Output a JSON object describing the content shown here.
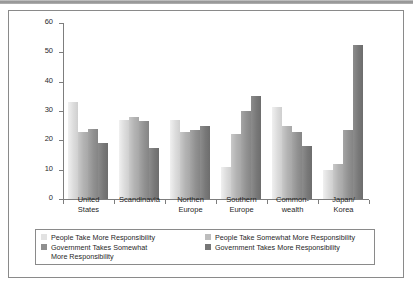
{
  "chart_data": {
    "type": "bar",
    "title": "",
    "subtitle": "",
    "xlabel": "",
    "ylabel": "",
    "ylim": [
      0,
      60
    ],
    "yticks": [
      0,
      10,
      20,
      30,
      40,
      50,
      60
    ],
    "grid": false,
    "legend_position": "bottom",
    "categories": [
      "United\nStates",
      "Scandinavia",
      "Northen\nEurope",
      "Southern\nEurope",
      "Common-\nwealth",
      "Japan/\nKorea"
    ],
    "series": [
      {
        "name": "People Take More Responsibility",
        "color": "#e2e2e2",
        "values": [
          33,
          27,
          27,
          11,
          31.5,
          10
        ]
      },
      {
        "name": "People Take Somewhat More Responsibility",
        "color": "#bdbdbd",
        "values": [
          23,
          28,
          23,
          22,
          25,
          12
        ]
      },
      {
        "name": "Government Takes Somewhat\nMore Responsibility",
        "color": "#8f8f8f",
        "values": [
          24,
          26.5,
          23.5,
          30,
          23,
          23.5
        ]
      },
      {
        "name": "Government Takes More Responsibility",
        "color": "#767676",
        "values": [
          19,
          17.5,
          25,
          35,
          18,
          52.5
        ]
      }
    ]
  },
  "legend": {
    "items": [
      "People Take More Responsibility",
      "People Take Somewhat More Responsibility",
      "Government Takes Somewhat\nMore Responsibility",
      "Government Takes More Responsibility"
    ]
  }
}
